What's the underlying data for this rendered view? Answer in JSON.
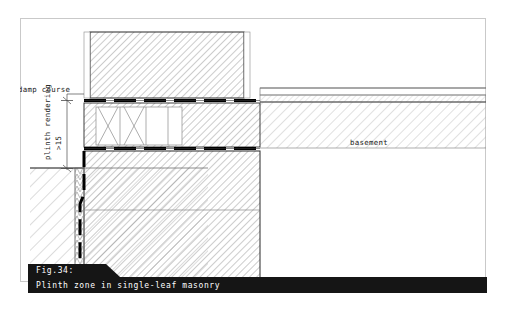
{
  "figure": {
    "number_label": "Fig.34:",
    "title": "Plinth zone in single-leaf masonry",
    "caption_bar_color": "#151515",
    "caption_text_color": "#ffffff",
    "page_border_color": "#c9c9c9"
  },
  "drawing": {
    "type": "architectural-section",
    "subject": "Plinth zone in single-leaf masonry",
    "labels": {
      "damp_course": "damp course",
      "plinth_rendering": "plinth rendering",
      "plinth_rendering_dimension": ">15",
      "basement": "basement"
    },
    "components": [
      {
        "name": "upper-masonry-wall",
        "label": "single-leaf masonry wall above damp course",
        "hatch": "diagonal-45",
        "stroke": "#1a1a1a"
      },
      {
        "name": "upper-damp-proof-course",
        "label": "damp course",
        "style": "thick-dashed-black-band",
        "color": "#000000"
      },
      {
        "name": "plinth-course-ventilated-block",
        "label": "plinth course with zigzag cavity",
        "hatch": "diagonal-45"
      },
      {
        "name": "lower-damp-proof-course",
        "label": "damp course",
        "style": "thick-dashed-black-band",
        "color": "#000000"
      },
      {
        "name": "lower-masonry-wall",
        "label": "basement wall below ground level",
        "hatch": "diagonal-45"
      },
      {
        "name": "plinth-rendering-layer",
        "label": "plinth rendering >15",
        "style": "thin-vertical-strip"
      },
      {
        "name": "vertical-waterproofing-membrane",
        "label": "vertical tanking membrane",
        "style": "thick-dashed-black-line",
        "color": "#000000"
      },
      {
        "name": "ground-soil",
        "label": "surrounding ground",
        "hatch": "diagonal-45-light"
      },
      {
        "name": "ground-level-line",
        "label": "finished ground level",
        "style": "thin-solid-line"
      },
      {
        "name": "basement-floor-slab",
        "label": "basement floor slab with screed and insulation",
        "hatch": "diagonal-45-light"
      },
      {
        "name": "plinth-rendering-dimension-line",
        "label": "height dimension of plinth rendering",
        "style": "dimension-line-with-ticks"
      }
    ]
  }
}
